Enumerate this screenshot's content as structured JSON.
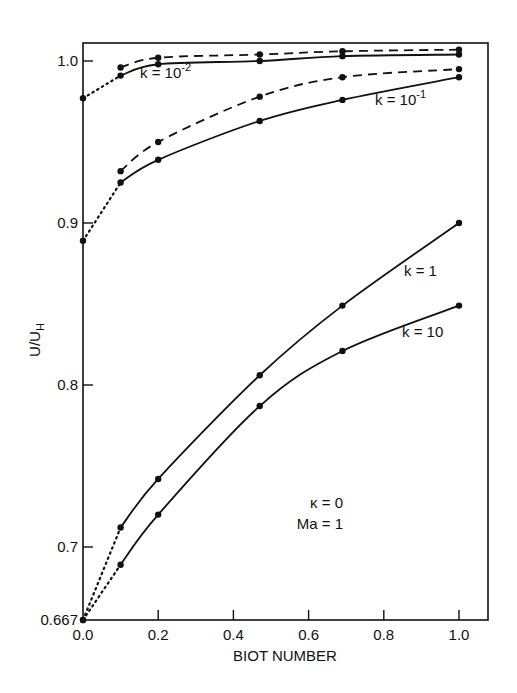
{
  "chart_data": {
    "type": "line",
    "title": "",
    "xlabel": "BIOT NUMBER",
    "ylabel": "U/U_H",
    "xlim": [
      0.0,
      1.05
    ],
    "ylim": [
      0.667,
      1.01
    ],
    "grid": false,
    "x_ticks": [
      "0.0",
      "0.2",
      "0.4",
      "0.6",
      "0.8",
      "1.0"
    ],
    "y_ticks": [
      "0.667",
      "0.7",
      "0.8",
      "0.9",
      "1.0"
    ],
    "annotations": [
      "κ = 0",
      "Ma = 1"
    ],
    "series": [
      {
        "name": "k = 10^-2 (dashed)",
        "style": "dashed",
        "x": [
          0.1,
          0.2,
          0.47,
          0.69,
          1.0
        ],
        "y": [
          0.996,
          1.002,
          1.004,
          1.006,
          1.007
        ]
      },
      {
        "name": "k = 10^-2",
        "style": "solid",
        "x": [
          0.0,
          0.1,
          0.2,
          0.47,
          0.69,
          1.0
        ],
        "y": [
          0.977,
          0.991,
          0.998,
          1.0,
          1.003,
          1.004
        ]
      },
      {
        "name": "k = 10^-1 (dashed)",
        "style": "dashed",
        "x": [
          0.1,
          0.2,
          0.47,
          0.69,
          1.0
        ],
        "y": [
          0.932,
          0.95,
          0.978,
          0.99,
          0.995
        ]
      },
      {
        "name": "k = 10^-1",
        "style": "solid",
        "x": [
          0.0,
          0.1,
          0.2,
          0.47,
          0.69,
          1.0
        ],
        "y": [
          0.889,
          0.925,
          0.939,
          0.963,
          0.976,
          0.99
        ]
      },
      {
        "name": "k = 1",
        "style": "solid",
        "x": [
          0.0,
          0.1,
          0.2,
          0.47,
          0.69,
          1.0
        ],
        "y": [
          0.667,
          0.712,
          0.742,
          0.806,
          0.849,
          0.9
        ]
      },
      {
        "name": "k = 10",
        "style": "solid",
        "x": [
          0.0,
          0.1,
          0.2,
          0.47,
          0.69,
          1.0
        ],
        "y": [
          0.667,
          0.692,
          0.72,
          0.787,
          0.821,
          0.849
        ]
      }
    ],
    "curve_labels": [
      "k = 10",
      "k = 10",
      "k = 1",
      "k = 10"
    ],
    "curve_label_exponents": [
      "-2",
      "-1",
      "",
      ""
    ]
  }
}
